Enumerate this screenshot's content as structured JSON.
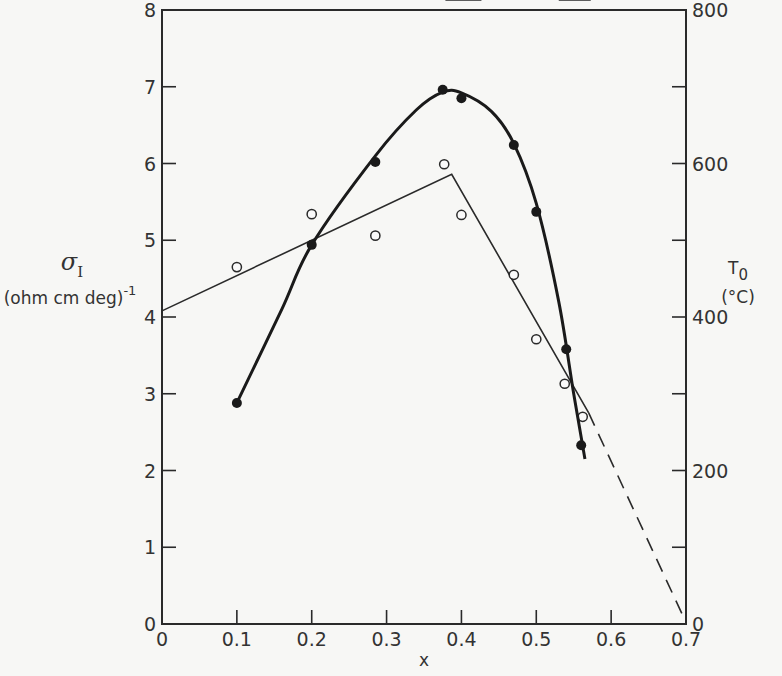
{
  "chart_data": {
    "type": "line",
    "title": "",
    "xlabel": "x",
    "ylabel_left": {
      "symbol": "σ",
      "subscript": "I",
      "units": "(ohm cm deg)",
      "units_exponent": "-1"
    },
    "ylabel_right": {
      "symbol": "T",
      "subscript": "0",
      "units": "(°C)"
    },
    "xlim": [
      0,
      0.7
    ],
    "ylim_left": [
      0,
      8
    ],
    "ylim_right": [
      0,
      800
    ],
    "x_ticks": [
      "0",
      "0.1",
      "0.2",
      "0.3",
      "0.4",
      "0.5",
      "0.6",
      "0.7"
    ],
    "y_ticks_left": [
      "0",
      "1",
      "2",
      "3",
      "4",
      "5",
      "6",
      "7",
      "8"
    ],
    "y_ticks_right": [
      "0",
      "200",
      "400",
      "600",
      "800"
    ],
    "grid": false,
    "legend": "none (arrows indicate axis: ← left σ_I, → right T_0)",
    "series": [
      {
        "name": "σ_I (open circles, left axis)",
        "axis": "left",
        "marker": "open-circle",
        "points": [
          {
            "x": 0.1,
            "y": 4.65
          },
          {
            "x": 0.2,
            "y": 5.34
          },
          {
            "x": 0.285,
            "y": 5.06
          },
          {
            "x": 0.377,
            "y": 5.99
          },
          {
            "x": 0.4,
            "y": 5.33
          },
          {
            "x": 0.47,
            "y": 4.55
          },
          {
            "x": 0.5,
            "y": 3.71
          },
          {
            "x": 0.538,
            "y": 3.13
          },
          {
            "x": 0.562,
            "y": 2.7
          }
        ],
        "fit_line": {
          "style": "thin solid piecewise linear, dashed extrapolation",
          "solid": [
            {
              "x": 0.0,
              "y": 4.08
            },
            {
              "x": 0.387,
              "y": 5.86
            },
            {
              "x": 0.57,
              "y": 2.75
            }
          ],
          "dashed": [
            {
              "x": 0.57,
              "y": 2.75
            },
            {
              "x": 0.7,
              "y": 0.02
            }
          ]
        }
      },
      {
        "name": "T_0 (filled circles, right axis)",
        "axis": "right",
        "marker": "filled-circle",
        "points": [
          {
            "x": 0.1,
            "y": 288
          },
          {
            "x": 0.2,
            "y": 494
          },
          {
            "x": 0.285,
            "y": 602
          },
          {
            "x": 0.375,
            "y": 696
          },
          {
            "x": 0.4,
            "y": 685
          },
          {
            "x": 0.47,
            "y": 624
          },
          {
            "x": 0.5,
            "y": 537
          },
          {
            "x": 0.54,
            "y": 358
          },
          {
            "x": 0.56,
            "y": 233
          }
        ],
        "fit_line": {
          "style": "thick smooth curve",
          "from_x": 0.1,
          "to_x": 0.565
        }
      }
    ],
    "annotations": [
      {
        "type": "arrow",
        "direction": "left",
        "refers_to": "σ_I series",
        "x": 0.4,
        "y_left": 4.8
      },
      {
        "type": "arrow",
        "direction": "right",
        "refers_to": "T_0 series",
        "x": 0.53,
        "y_left": 5.95
      }
    ]
  }
}
